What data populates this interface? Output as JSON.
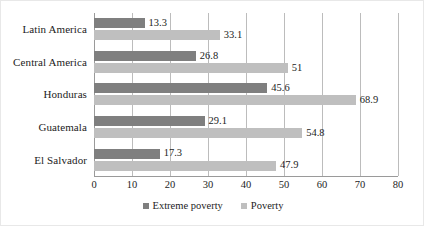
{
  "chart_data": {
    "type": "bar",
    "orientation": "horizontal",
    "title": "",
    "xlabel": "",
    "ylabel": "",
    "xlim": [
      0,
      80
    ],
    "grid": true,
    "legend_position": "bottom",
    "categories": [
      "Latin America",
      "Central America",
      "Honduras",
      "Guatemala",
      "El Salvador"
    ],
    "ticks": [
      0,
      10,
      20,
      30,
      40,
      50,
      60,
      70,
      80
    ],
    "tick_labels": [
      "0",
      "10",
      "20",
      "30",
      "40",
      "50",
      "60",
      "70",
      "80"
    ],
    "series": [
      {
        "name": "Extreme poverty",
        "color": "#7f7f7f",
        "values": [
          13.3,
          26.8,
          45.6,
          29.1,
          17.3
        ],
        "labels": [
          "13.3",
          "26.8",
          "45.6",
          "29.1",
          "17.3"
        ]
      },
      {
        "name": "Poverty",
        "color": "#bfbfbf",
        "values": [
          33.1,
          51,
          68.9,
          54.8,
          47.9
        ],
        "labels": [
          "33.1",
          "51",
          "68.9",
          "54.8",
          "47.9"
        ]
      }
    ]
  },
  "legend": {
    "entries": [
      {
        "label": "Extreme poverty",
        "color": "#7f7f7f"
      },
      {
        "label": "Poverty",
        "color": "#bfbfbf"
      }
    ]
  },
  "colors": {
    "extreme_poverty": "#7f7f7f",
    "poverty": "#bfbfbf",
    "gridline": "#bcbcbc",
    "axis": "#9a9a9a",
    "text": "#1c1c1c",
    "background": "#ffffff"
  }
}
